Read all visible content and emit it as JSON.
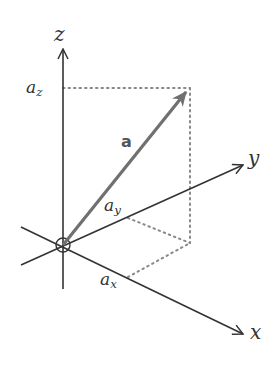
{
  "diagram": {
    "axes": {
      "x": {
        "label": "x"
      },
      "y": {
        "label": "y"
      },
      "z": {
        "label": "z"
      }
    },
    "vector": {
      "label": "a",
      "color": "#707070"
    },
    "components": {
      "ax": {
        "base": "a",
        "sub": "x"
      },
      "ay": {
        "base": "a",
        "sub": "y"
      },
      "az": {
        "base": "a",
        "sub": "z"
      }
    },
    "colors": {
      "axis": "#333333",
      "vector": "#707070",
      "dotted": "#888888"
    }
  }
}
